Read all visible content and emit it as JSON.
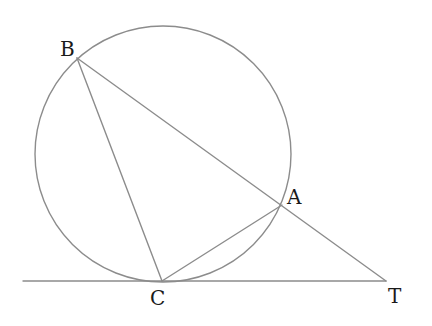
{
  "diagram": {
    "type": "geometry",
    "stroke_color": "#8c8c8c",
    "label_color": "#1a1a1a",
    "circle": {
      "cx": 163,
      "cy": 154,
      "r": 128
    },
    "points": {
      "B": {
        "label": "B",
        "x": 77,
        "y": 58,
        "label_x": 61,
        "label_y": 56
      },
      "A": {
        "label": "A",
        "x": 282,
        "y": 205,
        "label_x": 288,
        "label_y": 204
      },
      "C": {
        "label": "C",
        "x": 162,
        "y": 281,
        "label_x": 151,
        "label_y": 305
      },
      "T": {
        "label": "T",
        "x": 386,
        "y": 281,
        "label_x": 389,
        "label_y": 303
      }
    },
    "segments": [
      {
        "name": "BT",
        "from": "B",
        "to": "T"
      },
      {
        "name": "BC",
        "from": "B",
        "to": "C"
      },
      {
        "name": "CA",
        "from": "C",
        "to": "A"
      }
    ],
    "tangent_line": {
      "x1": 23,
      "y1": 281,
      "x2": 386,
      "y2": 281,
      "touches": "C"
    }
  }
}
